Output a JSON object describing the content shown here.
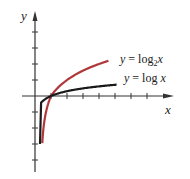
{
  "chart_data": {
    "type": "line",
    "title": "",
    "xlabel": "x",
    "ylabel": "y",
    "grid": false,
    "x_range": [
      0,
      8.5
    ],
    "y_range": [
      -4,
      5
    ],
    "unit_px": 16,
    "origin_px": [
      35,
      96
    ],
    "x_ticks": [
      1,
      2,
      3,
      4,
      5,
      6,
      7
    ],
    "y_ticks": [
      -4,
      -3,
      -2,
      -1,
      1,
      2,
      3,
      4
    ],
    "series": [
      {
        "name": "y = log2 x",
        "func": "log2",
        "color": "#b0373a",
        "x_min": 0.13,
        "x_max": 4.6,
        "label_prefix": "y",
        "label_eq": "= log",
        "label_sub": "2",
        "label_var": "x"
      },
      {
        "name": "y = log x",
        "func": "log10",
        "color": "#1a1a1a",
        "x_min": 0.001,
        "x_max": 5.1,
        "label_prefix": "y",
        "label_eq": "= log",
        "label_sub": "",
        "label_var": "x"
      }
    ]
  },
  "axes": {
    "x_label": "x",
    "y_label": "y"
  }
}
